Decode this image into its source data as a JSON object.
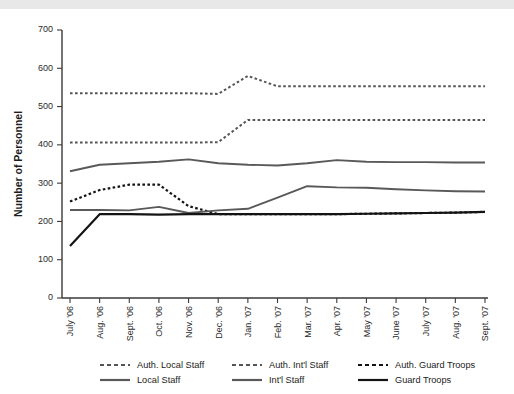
{
  "chart_data": {
    "type": "line",
    "title": "",
    "xlabel": "",
    "ylabel": "Number of Personnel",
    "ylim": [
      0,
      700
    ],
    "yticks": [
      0,
      100,
      200,
      300,
      400,
      500,
      600,
      700
    ],
    "grid": false,
    "legend_position": "bottom",
    "categories": [
      "July '06",
      "Aug. '06",
      "Sept. '06",
      "Oct. '06",
      "Nov. '06",
      "Dec. '06",
      "Jan. '07",
      "Feb. '07",
      "Mar. '07",
      "Apr. '07",
      "May '07",
      "June '07",
      "July '07",
      "Aug. '07",
      "Sept. '07"
    ],
    "series": [
      {
        "name": "Auth. Local Staff",
        "style": "dashed",
        "color": "#555555",
        "width": 2.0,
        "values": [
          535,
          535,
          535,
          535,
          535,
          533,
          580,
          553,
          553,
          553,
          553,
          553,
          553,
          553,
          553
        ]
      },
      {
        "name": "Auth. Int'l  Staff",
        "style": "dashed",
        "color": "#555555",
        "width": 2.0,
        "values": [
          406,
          406,
          406,
          406,
          406,
          407,
          465,
          465,
          465,
          465,
          465,
          465,
          465,
          465,
          465
        ]
      },
      {
        "name": "Auth. Guard Troops",
        "style": "dashed",
        "color": "#141414",
        "width": 2.2,
        "values": [
          252,
          282,
          296,
          296,
          240,
          219,
          219,
          219,
          219,
          219,
          220,
          221,
          222,
          223,
          225
        ]
      },
      {
        "name": "Local Staff",
        "style": "solid",
        "color": "#595959",
        "width": 1.9,
        "values": [
          331,
          348,
          352,
          356,
          362,
          352,
          348,
          346,
          352,
          360,
          356,
          355,
          355,
          354,
          354
        ]
      },
      {
        "name": "Int'l Staff",
        "style": "solid",
        "color": "#595959",
        "width": 1.9,
        "values": [
          230,
          230,
          229,
          238,
          222,
          229,
          233,
          262,
          292,
          289,
          288,
          284,
          281,
          279,
          278
        ]
      },
      {
        "name": "Guard Troops",
        "style": "solid",
        "color": "#141414",
        "width": 2.2,
        "values": [
          136,
          219,
          219,
          218,
          219,
          219,
          219,
          219,
          219,
          219,
          220,
          221,
          222,
          223,
          225
        ]
      }
    ]
  },
  "legend": {
    "rows": [
      [
        {
          "label": "Auth. Local Staff",
          "style": "dashed",
          "color": "#555555"
        },
        {
          "label": "Auth. Int'l  Staff",
          "style": "dashed",
          "color": "#555555"
        },
        {
          "label": "Auth. Guard Troops",
          "style": "dashed",
          "color": "#141414"
        }
      ],
      [
        {
          "label": "Local Staff",
          "style": "solid",
          "color": "#595959"
        },
        {
          "label": "Int'l Staff",
          "style": "solid",
          "color": "#595959"
        },
        {
          "label": "Guard Troops",
          "style": "141414"
        }
      ]
    ]
  }
}
